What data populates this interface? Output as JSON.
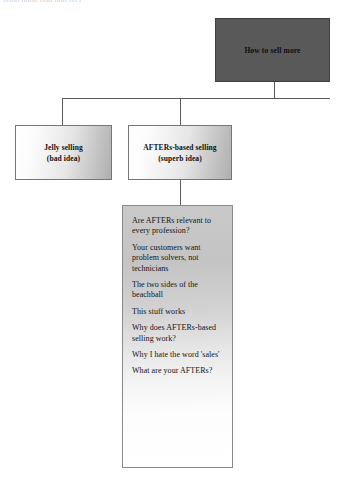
{
  "page": {
    "clipped_header_fragment": "nnnn nnnn nnn nnn nn nnn nn",
    "background_color": "#ffffff"
  },
  "diagram": {
    "type": "tree",
    "colors": {
      "root_fill": "#595959",
      "child_fill_start": "#ffffff",
      "child_fill_end": "#b0b0b0",
      "list_fill_start": "#c9c9c9",
      "list_fill_end": "#ffffff",
      "line": "#5a5a5a",
      "border": "#767676",
      "text": "#111111"
    },
    "root": {
      "label": "How to sell more"
    },
    "children": [
      {
        "label_line1": "Jelly selling",
        "label_line2": "(bad idea)"
      },
      {
        "label_line1": "AFTERs-based selling",
        "label_line2": "(superb idea)"
      }
    ],
    "detail_list": {
      "items": [
        "Are AFTERs relevant to every profession?",
        "Your customers want problem solvers, not technicians",
        "The two sides of the beachball",
        "This stuff works",
        "Why does AFTERs-based selling work?",
        "Why I hate the word 'sales'",
        "What are your AFTERs?"
      ]
    }
  }
}
